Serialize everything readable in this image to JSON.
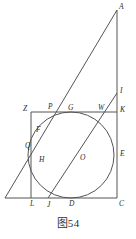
{
  "figure": {
    "caption": "图54",
    "stroke_color": "#555555",
    "label_color": "#2b2b2b",
    "background": "#ffffff",
    "width": 136,
    "height": 239,
    "points": [
      {
        "id": "A",
        "label": "A",
        "x": 117,
        "y": 10,
        "lx": 119,
        "ly": 9
      },
      {
        "id": "I",
        "label": "I",
        "x": 117,
        "y": 93,
        "lx": 120,
        "ly": 93
      },
      {
        "id": "K",
        "label": "K",
        "x": 117,
        "y": 112,
        "lx": 120,
        "ly": 112
      },
      {
        "id": "E",
        "label": "E",
        "x": 117,
        "y": 155,
        "lx": 120,
        "ly": 156
      },
      {
        "id": "C",
        "label": "C",
        "x": 117,
        "y": 198,
        "lx": 119,
        "ly": 206
      },
      {
        "id": "Z",
        "label": "Z",
        "x": 31,
        "y": 112,
        "lx": 23,
        "ly": 111
      },
      {
        "id": "P",
        "label": "P",
        "x": 50,
        "y": 112,
        "lx": 48,
        "ly": 109
      },
      {
        "id": "G",
        "label": "G",
        "x": 71,
        "y": 112,
        "lx": 68,
        "ly": 110
      },
      {
        "id": "W",
        "label": "W",
        "x": 101,
        "y": 112,
        "lx": 98,
        "ly": 110
      },
      {
        "id": "F",
        "label": "F",
        "x": 40,
        "y": 131,
        "lx": 36,
        "ly": 132
      },
      {
        "id": "Q",
        "label": "Q",
        "x": 32,
        "y": 146,
        "lx": 25,
        "ly": 148
      },
      {
        "id": "H",
        "label": "H",
        "x": 39,
        "y": 160,
        "lx": 39,
        "ly": 162
      },
      {
        "id": "O",
        "label": "O",
        "x": 69,
        "y": 155,
        "lx": 80,
        "ly": 160
      },
      {
        "id": "L",
        "label": "L",
        "x": 31,
        "y": 198,
        "lx": 30,
        "ly": 206
      },
      {
        "id": "J",
        "label": "J",
        "x": 48,
        "y": 198,
        "lx": 47,
        "ly": 207
      },
      {
        "id": "D",
        "label": "D",
        "x": 71,
        "y": 198,
        "lx": 69,
        "ly": 206
      }
    ],
    "segments": [
      {
        "name": "base-line-BC",
        "x1": 5,
        "y1": 198,
        "x2": 117,
        "y2": 198
      },
      {
        "name": "right-side-AC",
        "x1": 117,
        "y1": 10,
        "x2": 117,
        "y2": 198
      },
      {
        "name": "hypotenuse-AB",
        "x1": 117,
        "y1": 10,
        "x2": 5,
        "y2": 198
      },
      {
        "name": "square-top-ZK",
        "x1": 31,
        "y1": 112,
        "x2": 117,
        "y2": 112
      },
      {
        "name": "square-left-ZL",
        "x1": 31,
        "y1": 112,
        "x2": 31,
        "y2": 198
      },
      {
        "name": "cevian-JI",
        "x1": 48,
        "y1": 198,
        "x2": 117,
        "y2": 93
      }
    ],
    "circle": {
      "name": "inscribed-circle",
      "cx": 71,
      "cy": 155,
      "r": 43
    }
  }
}
